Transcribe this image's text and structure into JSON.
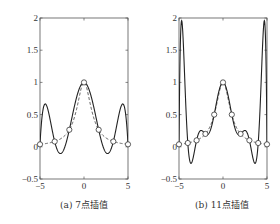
{
  "chart_data": [
    {
      "type": "line",
      "title": "",
      "caption": "(a) 7点插值",
      "xlabel": "",
      "ylabel": "",
      "xlim": [
        -5,
        5
      ],
      "ylim": [
        -0.5,
        2
      ],
      "xticks": [
        "-5",
        "0",
        "5"
      ],
      "yticks": [
        "-0.5",
        "0",
        "0.5",
        "1",
        "1.5",
        "2"
      ],
      "grid": false,
      "series": [
        {
          "name": "interpolating polynomial",
          "style": "solid",
          "function": "7-point Lagrange interpolation of 1/(1+x^2)"
        },
        {
          "name": "f(x)=1/(1+x^2)",
          "style": "dashed"
        },
        {
          "name": "nodes",
          "style": "markers-open-circle",
          "x": [
            -5,
            -3.333,
            -1.667,
            0,
            1.667,
            3.333,
            5
          ],
          "y": [
            0.038,
            0.083,
            0.265,
            1,
            0.265,
            0.083,
            0.038
          ]
        }
      ]
    },
    {
      "type": "line",
      "title": "",
      "caption": "(b) 11点插值",
      "xlabel": "",
      "ylabel": "",
      "xlim": [
        -5,
        5
      ],
      "ylim": [
        -0.5,
        2
      ],
      "xticks": [
        "-5",
        "0",
        "5"
      ],
      "yticks": [
        "-0.5",
        "0",
        "0.5",
        "1",
        "1.5",
        "2"
      ],
      "grid": false,
      "series": [
        {
          "name": "interpolating polynomial",
          "style": "solid",
          "function": "11-point Lagrange interpolation of 1/(1+x^2)"
        },
        {
          "name": "f(x)=1/(1+x^2)",
          "style": "dashed"
        },
        {
          "name": "nodes",
          "style": "markers-open-circle",
          "x": [
            -5,
            -4,
            -3,
            -2,
            -1,
            0,
            1,
            2,
            3,
            4,
            5
          ],
          "y": [
            0.038,
            0.059,
            0.1,
            0.2,
            0.5,
            1,
            0.5,
            0.2,
            0.1,
            0.059,
            0.038
          ]
        }
      ]
    }
  ]
}
